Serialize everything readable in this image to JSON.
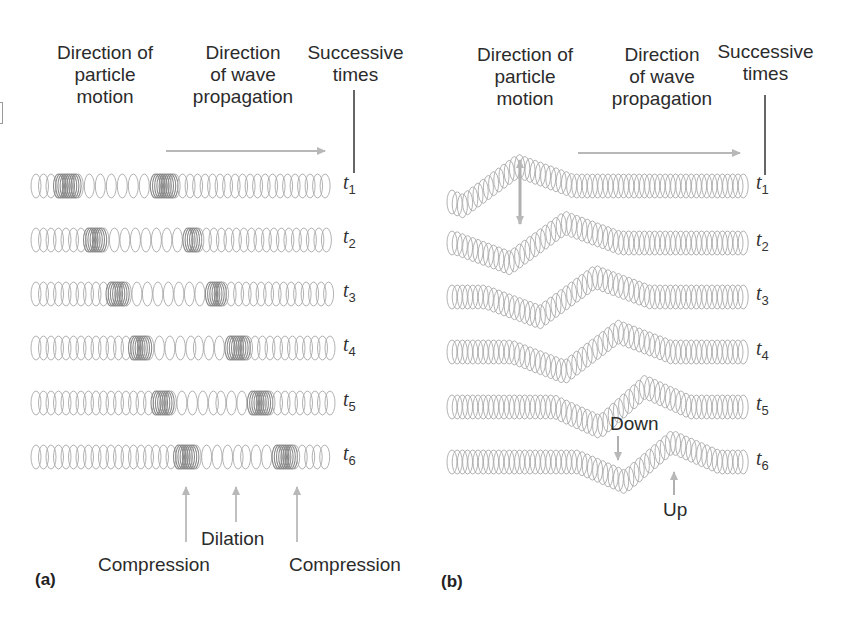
{
  "figure": {
    "panel_a": {
      "tag": "(a)",
      "label_particle_motion": [
        "Direction of",
        "particle",
        "motion"
      ],
      "label_wave_propagation": [
        "Direction",
        "of wave",
        "propagation"
      ],
      "label_successive_times": [
        "Successive",
        "times"
      ],
      "times": [
        {
          "t": "t",
          "sub": "1"
        },
        {
          "t": "t",
          "sub": "2"
        },
        {
          "t": "t",
          "sub": "3"
        },
        {
          "t": "t",
          "sub": "4"
        },
        {
          "t": "t",
          "sub": "5"
        },
        {
          "t": "t",
          "sub": "6"
        }
      ],
      "annotations": {
        "compression_left": "Compression",
        "dilation": "Dilation",
        "compression_right": "Compression"
      },
      "compression_positions_x": [
        [
          68,
          165
        ],
        [
          92,
          188
        ],
        [
          115,
          212
        ],
        [
          138,
          236
        ],
        [
          160,
          259
        ],
        [
          185,
          284
        ]
      ]
    },
    "panel_b": {
      "tag": "(b)",
      "label_particle_motion": [
        "Direction of",
        "particle",
        "motion"
      ],
      "label_wave_propagation": [
        "Direction",
        "of wave",
        "propagation"
      ],
      "label_successive_times": [
        "Successive",
        "times"
      ],
      "times": [
        {
          "t": "t",
          "sub": "1"
        },
        {
          "t": "t",
          "sub": "2"
        },
        {
          "t": "t",
          "sub": "3"
        },
        {
          "t": "t",
          "sub": "4"
        },
        {
          "t": "t",
          "sub": "5"
        },
        {
          "t": "t",
          "sub": "6"
        }
      ],
      "annotations": {
        "down": "Down",
        "up": "Up"
      },
      "wave_trough_x": [
        463,
        510,
        540,
        565,
        600,
        625
      ],
      "wave_crest_x": [
        518,
        565,
        595,
        618,
        645,
        672
      ]
    },
    "colors": {
      "spring": "#a9a9a9",
      "spring_dense": "#8a8a8a",
      "arrow": "#b8b8b8",
      "text": "#2b2b2b",
      "background": "#ffffff"
    }
  }
}
